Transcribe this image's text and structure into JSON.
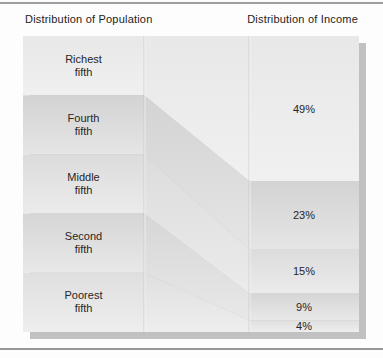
{
  "titles": {
    "population": "Distribution of Population",
    "income": "Distribution of Income"
  },
  "chart_data": {
    "type": "bar",
    "variant": "paired-100pct-stacked-flow",
    "title": "",
    "categories": [
      "Richest fifth",
      "Fourth fifth",
      "Middle fifth",
      "Second fifth",
      "Poorest fifth"
    ],
    "series": [
      {
        "name": "Distribution of Population",
        "unit": "%",
        "values": [
          20,
          20,
          20,
          20,
          20
        ]
      },
      {
        "name": "Distribution of Income",
        "unit": "%",
        "values": [
          49,
          23,
          15,
          9,
          4
        ]
      }
    ],
    "population_labels": [
      {
        "line1": "Richest",
        "line2": "fifth"
      },
      {
        "line1": "Fourth",
        "line2": "fifth"
      },
      {
        "line1": "Middle",
        "line2": "fifth"
      },
      {
        "line1": "Second",
        "line2": "fifth"
      },
      {
        "line1": "Poorest",
        "line2": "fifth"
      }
    ],
    "income_labels": [
      "49%",
      "23%",
      "15%",
      "9%",
      "4%"
    ],
    "legend_position": "none",
    "grid": false
  },
  "colors": {
    "band_gradients": [
      [
        "#e8e8e8",
        "#f0f0f0"
      ],
      [
        "#d3d3d3",
        "#e5e5e5"
      ],
      [
        "#dcdcdc",
        "#ebebeb"
      ],
      [
        "#d6d6d6",
        "#e8e8e8"
      ],
      [
        "#dfdfdf",
        "#eeeeee"
      ]
    ],
    "shadow": "#c1c1c1",
    "divider": "#bdbdbd",
    "divider_highlight": "#f6f6f6",
    "rule": "#9e9e9e",
    "text": "#262626"
  }
}
